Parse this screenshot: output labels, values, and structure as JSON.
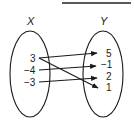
{
  "diagram": {
    "type": "mapping-diagram",
    "domain": {
      "label": "X",
      "elements": [
        "3",
        "−4",
        "−3"
      ]
    },
    "range": {
      "label": "Y",
      "elements": [
        "5",
        "−1",
        "2",
        "1"
      ]
    },
    "mappings": [
      {
        "from": "3",
        "to": "5"
      },
      {
        "from": "3",
        "to": "1"
      },
      {
        "from": "−4",
        "to": "−1"
      },
      {
        "from": "−3",
        "to": "2"
      }
    ],
    "colors": {
      "stroke": "#1a1a1a",
      "background": "#ffffff"
    }
  }
}
